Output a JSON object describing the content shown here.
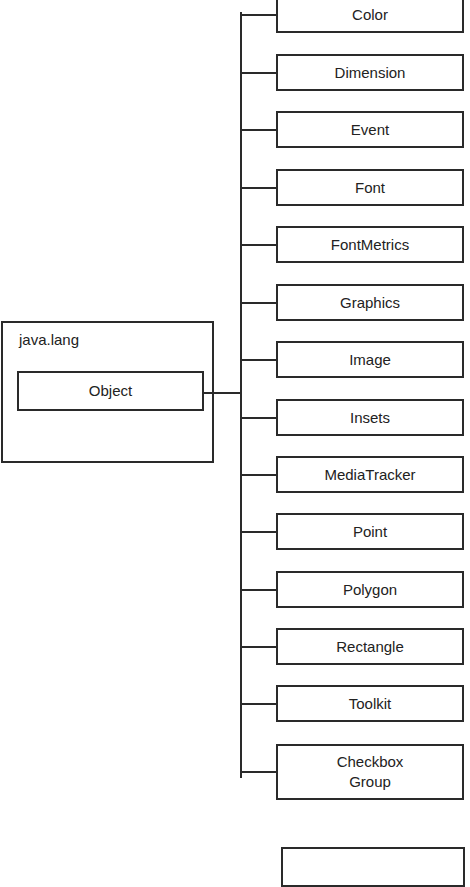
{
  "package": {
    "name": "java.lang",
    "root_class": "Object"
  },
  "children": [
    {
      "label": "Color",
      "top": -4,
      "height": 37
    },
    {
      "label": "Dimension",
      "top": 54,
      "height": 37
    },
    {
      "label": "Event",
      "top": 111,
      "height": 37
    },
    {
      "label": "Font",
      "top": 169,
      "height": 37
    },
    {
      "label": "FontMetrics",
      "top": 226,
      "height": 37
    },
    {
      "label": "Graphics",
      "top": 284,
      "height": 37
    },
    {
      "label": "Image",
      "top": 341,
      "height": 37
    },
    {
      "label": "Insets",
      "top": 399,
      "height": 37
    },
    {
      "label": "MediaTracker",
      "top": 456,
      "height": 37
    },
    {
      "label": "Point",
      "top": 513,
      "height": 37
    },
    {
      "label": "Polygon",
      "top": 571,
      "height": 37
    },
    {
      "label": "Rectangle",
      "top": 628,
      "height": 37
    },
    {
      "label": "Toolkit",
      "top": 685,
      "height": 37
    },
    {
      "label": "Checkbox\nGroup",
      "top": 744,
      "height": 56
    }
  ],
  "partial_box": {
    "label": ""
  },
  "colors": {
    "stroke": "#2a2a2a",
    "background": "#ffffff",
    "text": "#222222"
  }
}
